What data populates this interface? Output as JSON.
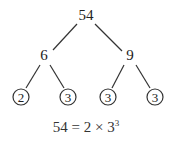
{
  "diagram": {
    "type": "factor-tree",
    "root": {
      "label": "54",
      "x": 86,
      "y": 20
    },
    "nodes": [
      {
        "id": "n6",
        "label": "6",
        "x": 44,
        "y": 59,
        "circled": false
      },
      {
        "id": "n9",
        "label": "9",
        "x": 130,
        "y": 59,
        "circled": false
      },
      {
        "id": "l1",
        "label": "2",
        "x": 21,
        "y": 97,
        "circled": true
      },
      {
        "id": "l2",
        "label": "3",
        "x": 68,
        "y": 97,
        "circled": true
      },
      {
        "id": "l3",
        "label": "3",
        "x": 108,
        "y": 97,
        "circled": true
      },
      {
        "id": "l4",
        "label": "3",
        "x": 155,
        "y": 97,
        "circled": true
      }
    ],
    "edges": [
      {
        "from": "54",
        "to": "6"
      },
      {
        "from": "54",
        "to": "9"
      },
      {
        "from": "6",
        "to": "2"
      },
      {
        "from": "6",
        "to": "3"
      },
      {
        "from": "9",
        "to": "3"
      },
      {
        "from": "9",
        "to": "3"
      }
    ],
    "caption": {
      "base": "54 = 2 × 3",
      "exponent": "3"
    }
  }
}
